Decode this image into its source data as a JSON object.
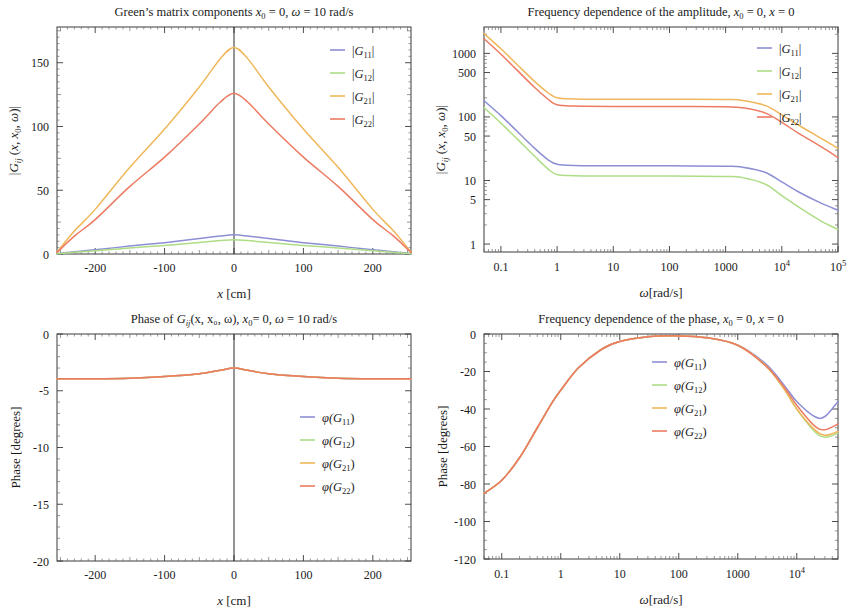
{
  "figure": {
    "series_colors": {
      "G11": "#8c8fd4",
      "G12": "#aedd86",
      "G21": "#f0b75a",
      "G22": "#ec7b62"
    },
    "frame_color": "#3a3a3a"
  },
  "panels": [
    {
      "id": "amplitude-vs-x",
      "title": "Green’s matrix components x₀ = 0, ω = 10 rad/s",
      "title_parts": {
        "lead": "Green’s matrix components ",
        "x0": "x",
        "x0sub": "0",
        "eq1": " = 0, ",
        "omega": "ω",
        "eq2": " = 10 rad/s"
      },
      "xlabel": "x [cm]",
      "ylabel": "|Gᵢⱼ (x, x₀, ω)|",
      "xticks": [
        "-200",
        "-100",
        "0",
        "100",
        "200"
      ],
      "yticks": [
        "0",
        "50",
        "100",
        "150"
      ],
      "legend": [
        "|G₁₁|",
        "|G₁₂|",
        "|G₂₁|",
        "|G₂₂|"
      ],
      "legend_keys": [
        "G11",
        "G12",
        "G21",
        "G22"
      ]
    },
    {
      "id": "amplitude-vs-omega",
      "title": "Frequency dependence of the amplitude, x₀ = 0, x = 0",
      "title_parts": {
        "lead": "Frequency dependence of the amplitude, ",
        "x0": "x",
        "x0sub": "0",
        "eq1": " = 0, ",
        "x": "x",
        "eq2": " = 0"
      },
      "xlabel": "ω[rad/s]",
      "ylabel": "|Gᵢⱼ (x, x₀, ω)|",
      "xticks": [
        "0.1",
        "1",
        "10",
        "100",
        "1000",
        "10⁴",
        "10⁵"
      ],
      "yticks": [
        "1",
        "5",
        "10",
        "50",
        "100",
        "500",
        "1000"
      ],
      "legend": [
        "|G₁₁|",
        "|G₁₂|",
        "|G₂₁|",
        "|G₂₂|"
      ],
      "legend_keys": [
        "G11",
        "G12",
        "G21",
        "G22"
      ]
    },
    {
      "id": "phase-vs-x",
      "title": "Phase of Gᵢⱼ(x, x₀, ω), x₀= 0, ω = 10 rad/s",
      "title_parts": {
        "lead": "Phase of ",
        "g": "G",
        "gsub": "ij",
        "args": "(x, x₀, ω), ",
        "x0": "x",
        "x0sub": "0",
        "eq1": "= 0, ",
        "omega": "ω",
        "eq2": " = 10 rad/s"
      },
      "xlabel": "x [cm]",
      "ylabel": "Phase [degrees]",
      "xticks": [
        "-200",
        "-100",
        "0",
        "100",
        "200"
      ],
      "yticks": [
        "0",
        "-5",
        "-10",
        "-15",
        "-20"
      ],
      "legend": [
        "φ(G₁₁)",
        "φ(G₁₂)",
        "φ(G₂₁)",
        "φ(G₂₂)"
      ],
      "legend_keys": [
        "G11",
        "G12",
        "G21",
        "G22"
      ]
    },
    {
      "id": "phase-vs-omega",
      "title": "Frequency dependence of the phase, x₀ = 0, x = 0",
      "title_parts": {
        "lead": "Frequency dependence of the phase, ",
        "x0": "x",
        "x0sub": "0",
        "eq1": " = 0, ",
        "x": "x",
        "eq2": " = 0"
      },
      "xlabel": "ω[rad/s]",
      "ylabel": "Phase [degrees]",
      "xticks": [
        "0.1",
        "1",
        "10",
        "100",
        "1000",
        "10⁴"
      ],
      "yticks": [
        "0",
        "-20",
        "-40",
        "-60",
        "-80",
        "-100",
        "-120"
      ],
      "legend": [
        "φ(G₁₁)",
        "φ(G₁₂)",
        "φ(G₂₁)",
        "φ(G₂₂)"
      ],
      "legend_keys": [
        "G11",
        "G12",
        "G21",
        "G22"
      ]
    }
  ],
  "chart_data": [
    {
      "type": "line",
      "panel": "amplitude-vs-x",
      "title": "Green’s matrix components x0 = 0, ω = 10 rad/s",
      "xlabel": "x [cm]",
      "ylabel": "|Gij (x, x0, ω)|",
      "xlim": [
        -255,
        255
      ],
      "ylim": [
        0,
        178
      ],
      "xticks": [
        -200,
        -100,
        0,
        100,
        200
      ],
      "yticks": [
        0,
        50,
        100,
        150
      ],
      "grid": false,
      "legend_position": "top-right",
      "x": [
        -255,
        -230,
        -200,
        -150,
        -100,
        -50,
        -20,
        0,
        20,
        50,
        100,
        150,
        200,
        230,
        255
      ],
      "series": [
        {
          "name": "|G11|",
          "color": "#8c8fd4",
          "values": [
            0.3,
            1.8,
            3.3,
            6.2,
            8.9,
            12.1,
            14.1,
            15.0,
            14.1,
            12.1,
            8.9,
            6.2,
            3.3,
            1.8,
            0.3
          ]
        },
        {
          "name": "|G12|",
          "color": "#aedd86",
          "values": [
            0.2,
            1.3,
            2.5,
            4.7,
            6.7,
            9.1,
            10.5,
            11.2,
            10.5,
            9.1,
            6.7,
            4.7,
            2.5,
            1.3,
            0.2
          ]
        },
        {
          "name": "|G21|",
          "color": "#f0b75a",
          "values": [
            1.5,
            18.0,
            35.0,
            68.0,
            98.0,
            131.0,
            153.0,
            162.0,
            153.0,
            131.0,
            98.0,
            68.0,
            35.0,
            18.0,
            1.5
          ]
        },
        {
          "name": "|G22|",
          "color": "#ec7b62",
          "values": [
            1.2,
            14.0,
            27.0,
            53.0,
            76.0,
            102.0,
            119.0,
            126.0,
            119.0,
            102.0,
            76.0,
            53.0,
            27.0,
            14.0,
            1.2
          ]
        }
      ]
    },
    {
      "type": "line",
      "panel": "amplitude-vs-omega",
      "title": "Frequency dependence of the amplitude, x0 = 0, x = 0",
      "xlabel": "ω[rad/s]",
      "ylabel": "|Gij (x, x0, ω)|",
      "xscale": "log",
      "yscale": "log",
      "xlim": [
        0.05,
        100000
      ],
      "ylim": [
        0.75,
        2600
      ],
      "xticks": [
        0.1,
        1,
        10,
        100,
        1000,
        10000,
        100000
      ],
      "yticks": [
        1,
        5,
        10,
        50,
        100,
        500,
        1000
      ],
      "grid": false,
      "legend_position": "top-right",
      "x": [
        0.05,
        0.1,
        0.2,
        0.4,
        0.7,
        1,
        2,
        10,
        100,
        1000,
        2000,
        5000,
        10000,
        20000,
        50000,
        100000
      ],
      "series": [
        {
          "name": "|G11|",
          "color": "#8c8fd4",
          "values": [
            180,
            105,
            58,
            32,
            21,
            18.0,
            17.2,
            17.0,
            17.0,
            16.8,
            16.2,
            13.5,
            9.5,
            6.6,
            4.4,
            3.4
          ]
        },
        {
          "name": "|G12|",
          "color": "#aedd86",
          "values": [
            140,
            80,
            44,
            24,
            15,
            12.4,
            11.9,
            11.8,
            11.8,
            11.6,
            11.1,
            8.8,
            5.8,
            3.8,
            2.3,
            1.7
          ]
        },
        {
          "name": "|G21|",
          "color": "#f0b75a",
          "values": [
            2050,
            1180,
            650,
            360,
            238,
            200,
            192,
            190,
            190,
            188,
            182,
            152,
            108,
            74,
            46,
            32
          ]
        },
        {
          "name": "|G22|",
          "color": "#ec7b62",
          "values": [
            1700,
            970,
            530,
            290,
            188,
            155,
            148,
            146,
            146,
            144,
            139,
            116,
            82,
            55,
            34,
            23
          ]
        }
      ]
    },
    {
      "type": "line",
      "panel": "phase-vs-x",
      "title": "Phase of Gij(x, x0, ω), x0= 0, ω = 10 rad/s",
      "xlabel": "x [cm]",
      "ylabel": "Phase [degrees]",
      "xlim": [
        -255,
        255
      ],
      "ylim": [
        -20,
        0
      ],
      "xticks": [
        -200,
        -100,
        0,
        100,
        200
      ],
      "yticks": [
        0,
        -5,
        -10,
        -15,
        -20
      ],
      "grid": false,
      "legend_position": "center-right",
      "x": [
        -255,
        -200,
        -150,
        -100,
        -50,
        -20,
        0,
        20,
        50,
        100,
        150,
        200,
        255
      ],
      "series": [
        {
          "name": "φ(G11)",
          "color": "#8c8fd4",
          "values": [
            -3.95,
            -3.95,
            -3.9,
            -3.75,
            -3.5,
            -3.2,
            -3.0,
            -3.2,
            -3.5,
            -3.75,
            -3.9,
            -3.95,
            -3.95
          ]
        },
        {
          "name": "φ(G12)",
          "color": "#aedd86",
          "values": [
            -3.95,
            -3.95,
            -3.9,
            -3.75,
            -3.5,
            -3.2,
            -3.0,
            -3.2,
            -3.5,
            -3.75,
            -3.9,
            -3.95,
            -3.95
          ]
        },
        {
          "name": "φ(G21)",
          "color": "#f0b75a",
          "values": [
            -3.95,
            -3.95,
            -3.9,
            -3.75,
            -3.5,
            -3.2,
            -3.0,
            -3.2,
            -3.5,
            -3.75,
            -3.9,
            -3.95,
            -3.95
          ]
        },
        {
          "name": "φ(G22)",
          "color": "#ec7b62",
          "values": [
            -3.95,
            -3.95,
            -3.9,
            -3.75,
            -3.5,
            -3.2,
            -3.0,
            -3.2,
            -3.5,
            -3.75,
            -3.9,
            -3.95,
            -3.95
          ]
        }
      ]
    },
    {
      "type": "line",
      "panel": "phase-vs-omega",
      "title": "Frequency dependence of the phase, x0 = 0, x = 0",
      "xlabel": "ω[rad/s]",
      "ylabel": "Phase [degrees]",
      "xscale": "log",
      "xlim": [
        0.05,
        50000
      ],
      "ylim": [
        -120,
        0
      ],
      "xticks": [
        0.1,
        1,
        10,
        100,
        1000,
        10000
      ],
      "yticks": [
        0,
        -20,
        -40,
        -60,
        -80,
        -100,
        -120
      ],
      "grid": false,
      "legend_position": "top-right",
      "x": [
        0.05,
        0.1,
        0.2,
        0.4,
        0.7,
        1,
        2,
        5,
        10,
        30,
        100,
        300,
        1000,
        3000,
        6000,
        10000,
        20000,
        30000,
        50000
      ],
      "series": [
        {
          "name": "φ(G11)",
          "color": "#8c8fd4",
          "values": [
            -85,
            -78,
            -66,
            -50,
            -37,
            -30,
            -18,
            -8,
            -4,
            -1.5,
            -1.0,
            -2.0,
            -6,
            -16,
            -27,
            -36,
            -44,
            -44,
            -36
          ]
        },
        {
          "name": "φ(G12)",
          "color": "#aedd86",
          "values": [
            -85,
            -78,
            -66,
            -50,
            -37,
            -30,
            -18,
            -8,
            -4,
            -1.5,
            -1.0,
            -2.0,
            -6,
            -17,
            -29,
            -40,
            -52,
            -55,
            -53
          ]
        },
        {
          "name": "φ(G21)",
          "color": "#f0b75a",
          "values": [
            -85,
            -78,
            -66,
            -50,
            -37,
            -30,
            -18,
            -8,
            -4,
            -1.5,
            -1.0,
            -2.0,
            -6,
            -17,
            -29,
            -40,
            -51,
            -54,
            -52
          ]
        },
        {
          "name": "φ(G22)",
          "color": "#ec7b62",
          "values": [
            -85,
            -78,
            -66,
            -50,
            -37,
            -30,
            -18,
            -8,
            -4,
            -1.5,
            -1.0,
            -2.0,
            -6,
            -17,
            -28,
            -38,
            -49,
            -51,
            -48
          ]
        }
      ]
    }
  ]
}
